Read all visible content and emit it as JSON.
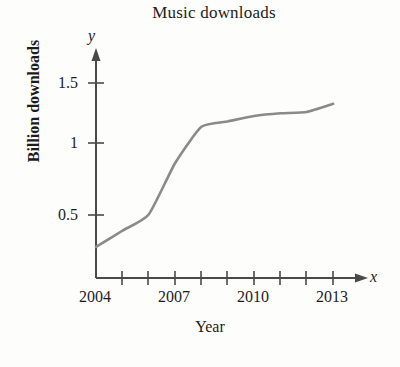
{
  "chart_data": {
    "type": "line",
    "title": "Music downloads",
    "xlabel": "Year",
    "ylabel": "Billion downloads",
    "x_axis_name": "x",
    "y_axis_name": "y",
    "grid": false,
    "legend": "none",
    "xlim": [
      2004,
      2014
    ],
    "ylim": [
      0,
      1.6
    ],
    "x_tick_labels": [
      "2004",
      "2007",
      "2010",
      "2013"
    ],
    "x_tick_values": [
      2004,
      2007,
      2010,
      2013
    ],
    "x_minor_ticks": [
      2005,
      2006,
      2008,
      2009,
      2011,
      2012
    ],
    "y_tick_labels": [
      "0.5",
      "1",
      "1.5"
    ],
    "y_tick_values": [
      0.5,
      1,
      1.5
    ],
    "series": [
      {
        "name": "Billion downloads",
        "color": "#8a8a8a",
        "x": [
          2004,
          2005,
          2006,
          2007,
          2008,
          2009,
          2010,
          2011,
          2012,
          2013
        ],
        "values": [
          0.23,
          0.35,
          0.47,
          0.85,
          1.12,
          1.16,
          1.2,
          1.22,
          1.23,
          1.29
        ]
      }
    ]
  },
  "figure": {
    "background_color": "#fdfdfc",
    "axis_color": "#4a4a4a",
    "curve_color": "#8a8a8a",
    "text_color": "#1c1c1c"
  }
}
